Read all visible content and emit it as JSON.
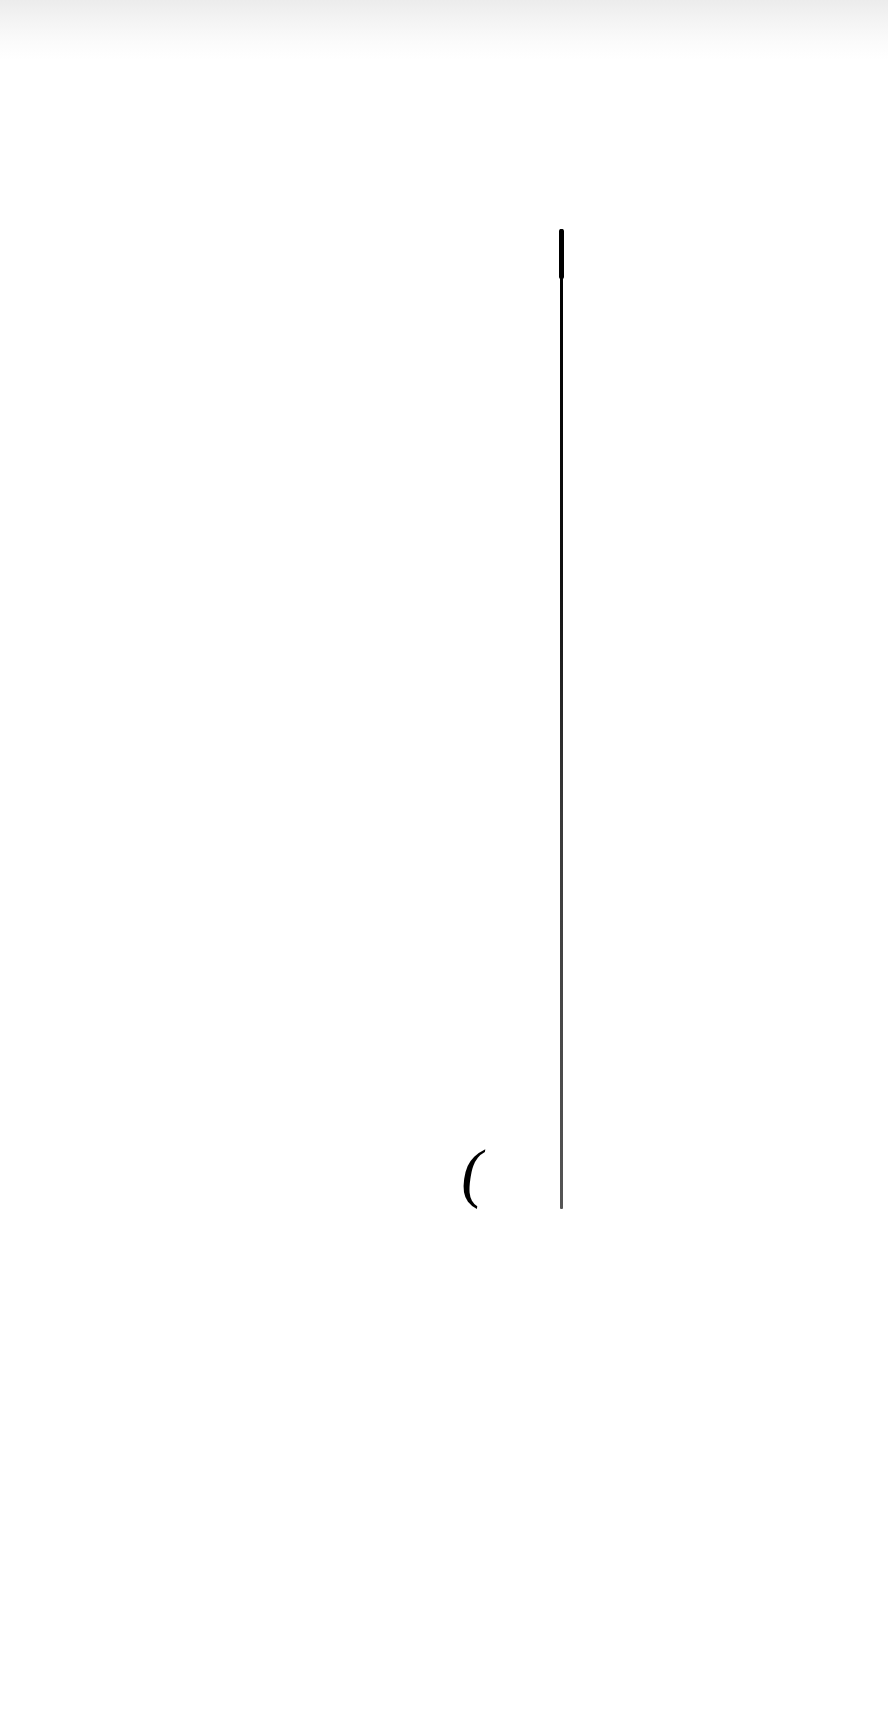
{
  "page": {
    "type": "scanned-document-page",
    "background_color": "#ffffff",
    "top_band_color": "#ececec"
  },
  "marks": {
    "gutter_line": {
      "color": "#000000",
      "x": 561,
      "y_start": 229,
      "y_end": 1208
    },
    "paren_glyph": "(",
    "bleed_through_text": ""
  }
}
